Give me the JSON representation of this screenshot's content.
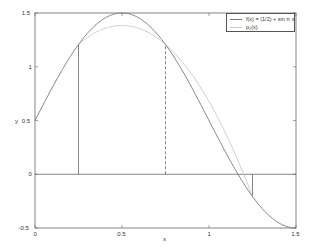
{
  "chart_data": {
    "type": "line",
    "title": "",
    "xlabel": "x",
    "ylabel": "y",
    "xlim": [
      0,
      1.5
    ],
    "ylim": [
      -0.5,
      1.5
    ],
    "x_ticks": [
      "0",
      "0.5",
      "1",
      "1.5"
    ],
    "y_ticks": [
      "-0.5",
      "0",
      "0.5",
      "1",
      "1.5"
    ],
    "grid": false,
    "legend_position": "upper right",
    "series": [
      {
        "name": "f(x) = (1/2) + sin π x",
        "expression": "0.5 + sin(pi*x)",
        "x_range": [
          0,
          1.5
        ],
        "color": "#777777",
        "style": "solid",
        "sample_points": [
          [
            0,
            0.5
          ],
          [
            0.25,
            1.2071
          ],
          [
            0.5,
            1.5
          ],
          [
            0.75,
            1.2071
          ],
          [
            1.0,
            0.5
          ],
          [
            1.25,
            -0.2071
          ],
          [
            1.5,
            -0.5
          ]
        ]
      },
      {
        "name": "p₂(x)",
        "expression": "-2.8284*(x-0.5)^2 + 1.3839",
        "x_range": [
          0.25,
          1.25
        ],
        "color": "#c8c8c8",
        "style": "solid",
        "sample_points": [
          [
            0.25,
            1.2071
          ],
          [
            0.5,
            1.3839
          ],
          [
            0.75,
            1.2071
          ],
          [
            1.0,
            0.6768
          ],
          [
            1.25,
            -0.2071
          ]
        ]
      }
    ],
    "annotations": [
      {
        "type": "hline",
        "y": 0,
        "x_range": [
          0,
          1.5
        ],
        "style": "solid"
      },
      {
        "type": "vline",
        "x": 0.25,
        "y_range": [
          0,
          1.2071
        ],
        "style": "solid"
      },
      {
        "type": "vline",
        "x": 0.75,
        "y_range": [
          0,
          1.2071
        ],
        "style": "dashed"
      },
      {
        "type": "vline",
        "x": 1.25,
        "y_range": [
          -0.2071,
          0
        ],
        "style": "solid"
      }
    ]
  },
  "legend": {
    "entries": [
      "f(x) = (1/2) + sin π x",
      "p₂(x)"
    ]
  },
  "axes": {
    "xlabel": "x",
    "ylabel": "y",
    "x_ticks": [
      "0",
      "0.5",
      "1",
      "1.5"
    ],
    "y_ticks": [
      "1.5",
      "1",
      "0.5",
      "0",
      "-0.5"
    ]
  }
}
